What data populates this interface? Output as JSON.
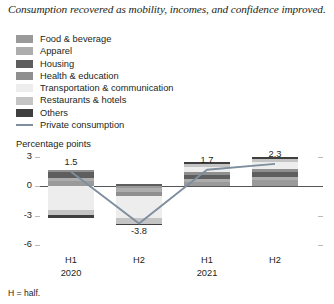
{
  "title": "Consumption recovered as mobility, incomes, and confidence improved.",
  "axis_unit_label": "Percentage points",
  "footnote": "H = half.",
  "legend": {
    "items": [
      {
        "label": "Food & beverage",
        "color": "#9a9a9a",
        "type": "swatch"
      },
      {
        "label": "Apparel",
        "color": "#adadad",
        "type": "swatch"
      },
      {
        "label": "Housing",
        "color": "#5e5e5e",
        "type": "swatch"
      },
      {
        "label": "Health & education",
        "color": "#8f8f8f",
        "type": "swatch"
      },
      {
        "label": "Transportation & communication",
        "color": "#ededed",
        "type": "swatch"
      },
      {
        "label": "Restaurants & hotels",
        "color": "#c4c4c4",
        "type": "swatch"
      },
      {
        "label": "Others",
        "color": "#3f3f3f",
        "type": "swatch"
      },
      {
        "label": "Private consumption",
        "color": "#7f8e9e",
        "type": "line"
      }
    ]
  },
  "chart_data": {
    "type": "bar",
    "stacked": true,
    "title": "Consumption recovered as mobility, incomes, and confidence improved.",
    "xlabel": "",
    "ylabel": "Percentage points",
    "ylim": [
      -6,
      3
    ],
    "yticks": [
      3,
      0,
      -3,
      -6
    ],
    "ytick_labels": [
      "3",
      "0",
      "-3",
      "-6"
    ],
    "grid": false,
    "legend_position": "top-left",
    "categories": [
      "H1",
      "H2",
      "H1",
      "H2"
    ],
    "category_groups": [
      {
        "label": "2020",
        "spans": [
          "H1",
          "H2"
        ]
      },
      {
        "label": "2021",
        "spans": [
          "H1",
          "H2"
        ]
      }
    ],
    "series": [
      {
        "name": "Food & beverage",
        "color": "#9a9a9a",
        "values": [
          0.55,
          -0.2,
          0.45,
          0.6
        ]
      },
      {
        "name": "Apparel",
        "color": "#adadad",
        "values": [
          0.25,
          -0.35,
          0.25,
          0.3
        ]
      },
      {
        "name": "Housing",
        "color": "#5e5e5e",
        "values": [
          0.7,
          0.2,
          0.45,
          0.55
        ]
      },
      {
        "name": "Health & education",
        "color": "#8f8f8f",
        "values": [
          0.2,
          -0.45,
          0.3,
          0.35
        ]
      },
      {
        "name": "Transportation & communication",
        "color": "#ededed",
        "values": [
          -2.4,
          -2.2,
          0.55,
          0.7
        ]
      },
      {
        "name": "Restaurants & hotels",
        "color": "#c4c4c4",
        "values": [
          -0.55,
          -0.65,
          0.25,
          0.3
        ]
      },
      {
        "name": "Others",
        "color": "#3f3f3f",
        "values": [
          -0.25,
          -0.15,
          0.2,
          0.2
        ]
      }
    ],
    "line_series": {
      "name": "Private consumption",
      "color": "#7f8e9e",
      "values": [
        1.5,
        -3.8,
        1.7,
        2.3
      ]
    },
    "data_labels": [
      "1.5",
      "-3.8",
      "1.7",
      "2.3"
    ],
    "annotations": []
  }
}
